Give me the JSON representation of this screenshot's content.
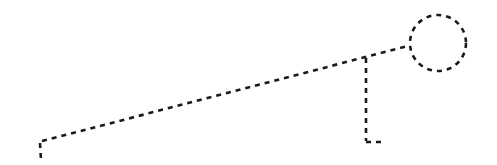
{
  "diagram": {
    "background": "#ffffff",
    "stroke_color": "#1a1a1a",
    "stroke_width": 2.6,
    "dash_pattern": "5,5",
    "elements": {
      "left_drop": {
        "x1": 40,
        "y1": 143,
        "x2": 41,
        "y2": 160
      },
      "diagonal": {
        "x1": 42,
        "y1": 141,
        "x2": 408,
        "y2": 46
      },
      "circle": {
        "cx": 438,
        "cy": 43,
        "r": 28
      },
      "vertical_drop": {
        "x1": 366,
        "y1": 58,
        "x2": 366,
        "y2": 141
      },
      "bottom_tick": {
        "x1": 366,
        "y1": 142,
        "x2": 382,
        "y2": 142
      }
    }
  }
}
